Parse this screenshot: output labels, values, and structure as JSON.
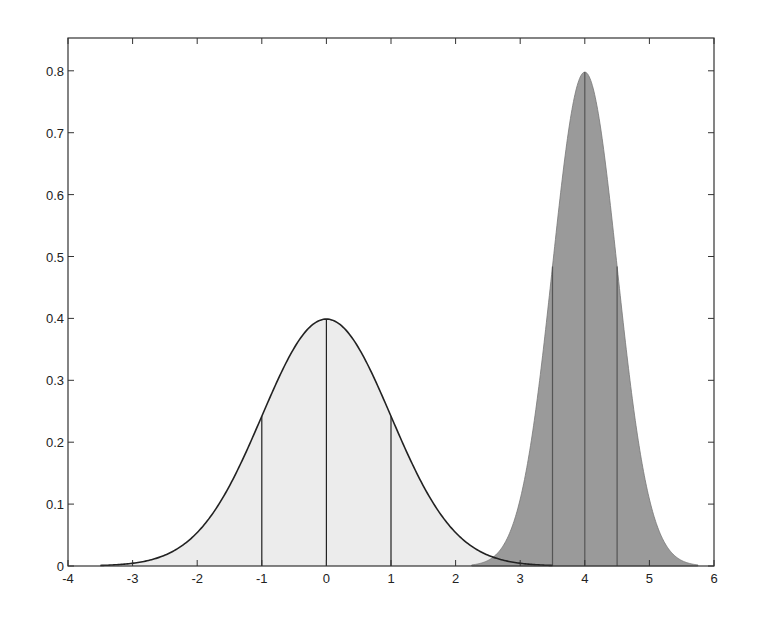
{
  "chart_data": {
    "type": "area",
    "title": "",
    "xlabel": "",
    "ylabel": "",
    "xlim": [
      -4,
      6
    ],
    "ylim": [
      0,
      0.853
    ],
    "grid": false,
    "legend": null,
    "x_ticks": [
      -4,
      -3,
      -2,
      -1,
      0,
      1,
      2,
      3,
      4,
      5,
      6
    ],
    "x_tick_labels": [
      "-4",
      "-3",
      "-2",
      "-1",
      "0",
      "1",
      "2",
      "3",
      "4",
      "5",
      "6"
    ],
    "y_ticks": [
      0,
      0.1,
      0.2,
      0.3,
      0.4,
      0.5,
      0.6,
      0.7,
      0.8
    ],
    "y_tick_labels": [
      "0",
      "0.1",
      "0.2",
      "0.3",
      "0.4",
      "0.5",
      "0.6",
      "0.7",
      "0.8"
    ],
    "series": [
      {
        "name": "Normal(mean=0, sd=1)",
        "distribution": "normal",
        "mean": 0,
        "sd": 1,
        "peak": 0.399,
        "x_range": [
          -3.5,
          3.5
        ],
        "fill": "#ececec",
        "vertical_lines_at": [
          -1,
          0,
          1
        ],
        "outline": true
      },
      {
        "name": "Normal(mean=4, sd=0.5)",
        "distribution": "normal",
        "mean": 4,
        "sd": 0.5,
        "peak": 0.798,
        "x_range": [
          2.25,
          5.75
        ],
        "fill": "#9a9a9a",
        "vertical_lines_at": [
          3.5,
          4,
          4.5
        ],
        "outline": false
      }
    ]
  }
}
